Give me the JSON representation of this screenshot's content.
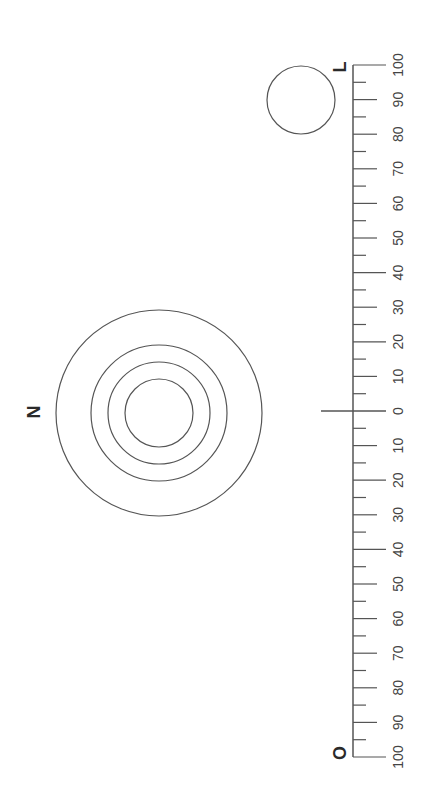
{
  "diagram": {
    "type": "optics/distance scale diagram",
    "orientation": "rotated -90deg",
    "colors": {
      "stroke": "#555555",
      "text": "#444444",
      "label": "#2a2a2a",
      "background": "#ffffff"
    },
    "labels": {
      "N": "N",
      "L": "L",
      "O": "O"
    },
    "scale": {
      "line_x": 353,
      "zero_y": 411,
      "px_per_unit": 3.46,
      "range": [
        -100,
        100
      ],
      "major_step": 10,
      "minor_step": 5,
      "tick_labels_upper": [
        "100",
        "90",
        "80",
        "70",
        "60",
        "50",
        "40",
        "30",
        "20",
        "10",
        "0"
      ],
      "tick_labels_lower": [
        "10",
        "20",
        "30",
        "40",
        "50",
        "60",
        "70",
        "80",
        "90",
        "100"
      ],
      "long_ticks": [
        0,
        20,
        40,
        100,
        -20,
        -40,
        -100
      ]
    },
    "concentric_circles": {
      "center": [
        159,
        413
      ],
      "radii": [
        103,
        68,
        51,
        34
      ],
      "label": "N"
    },
    "small_circle": {
      "center": [
        301,
        100
      ],
      "radius": 34,
      "label": "L"
    },
    "zero_crossline": {
      "x1": 321,
      "x2": 386,
      "y": 411
    }
  }
}
